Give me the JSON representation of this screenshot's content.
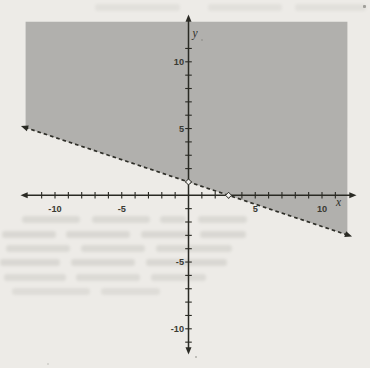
{
  "page": {
    "background_color": "#edebe7",
    "region_fill_color": "#b1b0ad"
  },
  "chart_data": {
    "type": "area",
    "subtype": "linear-inequality-region",
    "title": "",
    "xlabel": "x",
    "ylabel": "y",
    "axes": {
      "xlim": [
        -12.6,
        12.6
      ],
      "ylim": [
        -12.6,
        13.4
      ],
      "tick_step": 1,
      "tick_range": [
        -11,
        11
      ],
      "x_tick_labels": [
        -10,
        -5,
        5,
        10
      ],
      "y_tick_labels": [
        -10,
        -5,
        5,
        10
      ],
      "grid": false,
      "arrows": "both-ends"
    },
    "boundary_line": {
      "equation": "y = -(1/3)x + 1",
      "slope": -0.3333333,
      "y_intercept": 1,
      "x_intercept": 3,
      "style": "dashed",
      "arrows": "both-ends",
      "extent_x": [
        -12.55,
        12.25
      ],
      "open_points": [
        {
          "x": 0,
          "y": 1
        },
        {
          "x": 3,
          "y": 0
        }
      ]
    },
    "shaded_region": {
      "inequality": "y > -(1/3)x + 1",
      "side": "above-line",
      "bounds": {
        "left": -12.2,
        "right": 11.9,
        "top": 13.0
      },
      "fill_color": "#b1b0ad"
    },
    "colors": {
      "axis": "#2a2a24",
      "tick_label": "#3a3a33",
      "boundary_line": "#2e2e28",
      "open_point_fill": "#f0efec",
      "paper": "#edebe7"
    }
  }
}
